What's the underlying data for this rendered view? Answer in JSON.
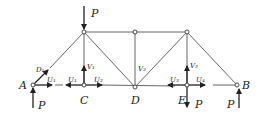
{
  "diagram": {
    "type": "truss",
    "nodes": {
      "A": {
        "label": "A"
      },
      "B": {
        "label": "B"
      },
      "C": {
        "label": "C"
      },
      "D": {
        "label": "D"
      },
      "E": {
        "label": "E"
      }
    },
    "loads": {
      "top_load": "P",
      "reaction_A": "P",
      "reaction_B": "P",
      "load_E": "P"
    },
    "member_forces": {
      "D1": "D₁",
      "U1_A": "U₁",
      "U1_C": "U₁",
      "U2": "U₂",
      "V1": "V₁",
      "V2": "V₂",
      "U3": "U₃",
      "V3": "V₃",
      "U4": "U₄"
    }
  }
}
